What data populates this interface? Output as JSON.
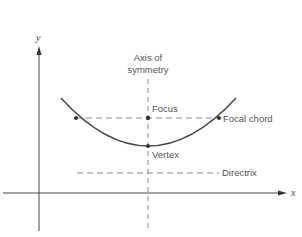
{
  "diagram": {
    "axes": {
      "x_label": "x",
      "y_label": "y"
    },
    "labels": {
      "axis_of_symmetry_line1": "Axis of",
      "axis_of_symmetry_line2": "symmetry",
      "focus": "Focus",
      "focal_chord": "Focal chord",
      "vertex": "Vertex",
      "directrix": "Directrix"
    },
    "colors": {
      "curve": "#444444",
      "axes": "#444444",
      "dashed": "#777777",
      "text": "#555555"
    },
    "points": {
      "vertex": [
        148,
        146
      ],
      "focus": [
        148,
        118
      ],
      "focal_chord_left": [
        76,
        118
      ],
      "focal_chord_right": [
        219,
        118
      ]
    }
  }
}
